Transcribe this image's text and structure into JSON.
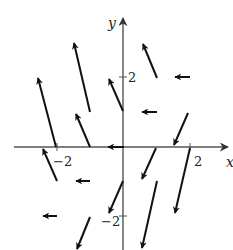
{
  "figure": {
    "type": "vector-field",
    "axes": {
      "x_label": "x",
      "y_label": "y",
      "x_tick_labels": [
        "−2",
        "2"
      ],
      "y_tick_labels": [
        "2",
        "−2"
      ],
      "x_ticks": [
        -2,
        2
      ],
      "y_ticks": [
        2,
        -2
      ]
    },
    "colors": {
      "ink": "#111111",
      "axis": "#555555",
      "background": "#ffffff"
    },
    "arrows": [
      {
        "x1": 56,
        "y1": 147,
        "x2": 38,
        "y2": 78
      },
      {
        "x1": 90,
        "y1": 112,
        "x2": 74,
        "y2": 43
      },
      {
        "x1": 123,
        "y1": 111,
        "x2": 109,
        "y2": 79
      },
      {
        "x1": 90,
        "y1": 147,
        "x2": 76,
        "y2": 114
      },
      {
        "x1": 157,
        "y1": 78,
        "x2": 143,
        "y2": 44
      },
      {
        "x1": 190,
        "y1": 77,
        "x2": 175,
        "y2": 77
      },
      {
        "x1": 157,
        "y1": 112,
        "x2": 142,
        "y2": 112
      },
      {
        "x1": 124,
        "y1": 147,
        "x2": 108,
        "y2": 147
      },
      {
        "x1": 188,
        "y1": 113,
        "x2": 174,
        "y2": 145
      },
      {
        "x1": 57,
        "y1": 181,
        "x2": 43,
        "y2": 149
      },
      {
        "x1": 90,
        "y1": 181,
        "x2": 76,
        "y2": 181
      },
      {
        "x1": 57,
        "y1": 216,
        "x2": 43,
        "y2": 216
      },
      {
        "x1": 123,
        "y1": 181,
        "x2": 109,
        "y2": 213
      },
      {
        "x1": 156,
        "y1": 148,
        "x2": 142,
        "y2": 179
      },
      {
        "x1": 190,
        "y1": 148,
        "x2": 175,
        "y2": 213
      },
      {
        "x1": 157,
        "y1": 181,
        "x2": 142,
        "y2": 248
      },
      {
        "x1": 90,
        "y1": 217,
        "x2": 77,
        "y2": 249
      }
    ]
  }
}
